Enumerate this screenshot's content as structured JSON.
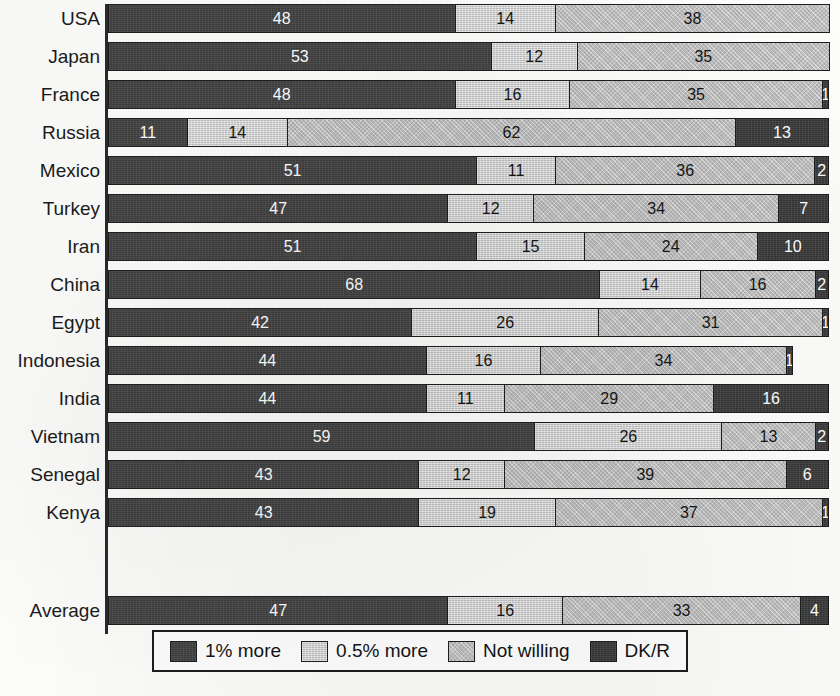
{
  "chart_data": {
    "type": "bar",
    "title": "",
    "subtitle": "",
    "xlabel": "",
    "ylabel": "",
    "orientation": "horizontal",
    "stacked": true,
    "stack_total": 100,
    "xlim": [
      0,
      100
    ],
    "grid": false,
    "legend_position": "bottom",
    "value_labels": true,
    "categories": [
      "USA",
      "Japan",
      "France",
      "Russia",
      "Mexico",
      "Turkey",
      "Iran",
      "China",
      "Egypt",
      "Indonesia",
      "India",
      "Vietnam",
      "Senegal",
      "Kenya"
    ],
    "summary_category": "Average",
    "legend": [
      "1% more",
      "0.5% more",
      "Not willing",
      "DK/R"
    ],
    "series": [
      {
        "name": "1% more",
        "color": "#434343",
        "values": [
          48,
          53,
          48,
          11,
          51,
          47,
          51,
          68,
          42,
          44,
          44,
          59,
          43,
          43
        ],
        "summary": 47
      },
      {
        "name": "0.5% more",
        "color": "#cfcfcf",
        "values": [
          14,
          12,
          16,
          14,
          11,
          12,
          15,
          14,
          26,
          16,
          11,
          26,
          12,
          19
        ],
        "summary": 16
      },
      {
        "name": "Not willing",
        "color": "#c2c2c2",
        "values": [
          38,
          35,
          35,
          62,
          36,
          34,
          24,
          16,
          31,
          34,
          29,
          13,
          39,
          37
        ],
        "summary": 33
      },
      {
        "name": "DK/R",
        "color": "#3b3b3b",
        "values": [
          0,
          0,
          1,
          13,
          2,
          7,
          10,
          2,
          1,
          6,
          16,
          2,
          6,
          1
        ],
        "summary": 4
      }
    ],
    "rows": [
      {
        "label": "USA",
        "values": [
          48,
          14,
          38,
          0
        ]
      },
      {
        "label": "Japan",
        "values": [
          53,
          12,
          35,
          0
        ]
      },
      {
        "label": "France",
        "values": [
          48,
          16,
          35,
          1
        ]
      },
      {
        "label": "Russia",
        "values": [
          11,
          14,
          62,
          13
        ]
      },
      {
        "label": "Mexico",
        "values": [
          51,
          11,
          36,
          2
        ]
      },
      {
        "label": "Turkey",
        "values": [
          47,
          12,
          34,
          7
        ]
      },
      {
        "label": "Iran",
        "values": [
          51,
          15,
          24,
          10
        ]
      },
      {
        "label": "China",
        "values": [
          68,
          14,
          16,
          2
        ]
      },
      {
        "label": "Egypt",
        "values": [
          42,
          26,
          31,
          1
        ]
      },
      {
        "label": "Indonesia",
        "values": [
          44,
          16,
          34,
          1
        ]
      },
      {
        "label": "India",
        "values": [
          44,
          11,
          29,
          16
        ]
      },
      {
        "label": "Vietnam",
        "values": [
          59,
          26,
          13,
          2
        ]
      },
      {
        "label": "Senegal",
        "values": [
          43,
          12,
          39,
          6
        ]
      },
      {
        "label": "Kenya",
        "values": [
          43,
          19,
          37,
          1
        ]
      },
      {
        "label": "Average",
        "values": [
          47,
          16,
          33,
          4
        ],
        "is_summary": true
      }
    ]
  },
  "notes": {
    "cropped_title_fragment": ""
  }
}
